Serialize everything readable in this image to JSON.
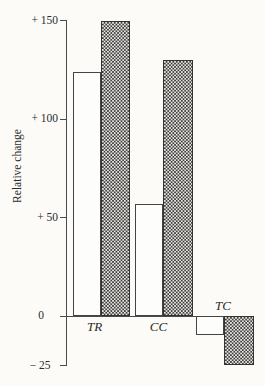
{
  "chart_data": {
    "type": "bar",
    "title": "",
    "ylabel": "Relative change",
    "xlabel": "",
    "categories": [
      "TR",
      "CC",
      "TC"
    ],
    "series": [
      {
        "name": "open-white-bar",
        "pattern": "open",
        "values": [
          124,
          57,
          -10
        ]
      },
      {
        "name": "stippled-dotted-bar",
        "pattern": "stipple",
        "values": [
          150,
          130,
          -25
        ]
      }
    ],
    "ylim": [
      -25,
      150
    ],
    "y_ticks": [
      {
        "label": "+ 150",
        "value": 150
      },
      {
        "label": "+ 100",
        "value": 100
      },
      {
        "label": "+ 50",
        "value": 50
      },
      {
        "label": "0",
        "value": 0
      },
      {
        "label": "− 25",
        "value": -25
      }
    ],
    "grid": false,
    "legend": "none",
    "colors": {
      "axis_line": "#4a4a4a",
      "bar_outline": "#444444",
      "open_bar_fill": "#fdfdfb",
      "stipple_dark": "#3e3e3e",
      "stipple_light": "#e9e7e2",
      "text": "#2b2b2b",
      "background": "#fcfbf8"
    }
  }
}
